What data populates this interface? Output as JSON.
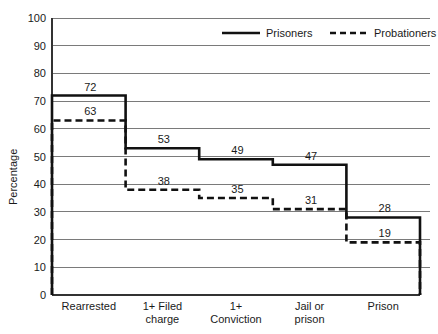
{
  "chart_data": {
    "type": "line",
    "title": "",
    "subtitle": "",
    "xlabel": "",
    "ylabel": "Percentage",
    "ylim": [
      0,
      100
    ],
    "ytick_step": 10,
    "yticks": [
      "0",
      "10",
      "20",
      "30",
      "40",
      "50",
      "60",
      "70",
      "80",
      "90",
      "100"
    ],
    "grid": true,
    "legend_position": "top-center",
    "step_style": "post",
    "categories": [
      "Rearrested",
      "1+ Filed charge",
      "1+ Conviction",
      "Jail or prison",
      "Prison"
    ],
    "category_lines": [
      [
        "Rearrested"
      ],
      [
        "1+ Filed",
        "charge"
      ],
      [
        "1+",
        "Conviction"
      ],
      [
        "Jail or",
        "prison"
      ],
      [
        "Prison"
      ]
    ],
    "series": [
      {
        "name": "Prisoners",
        "style": "solid",
        "color": "#111111",
        "values": [
          72,
          53,
          49,
          47,
          28
        ],
        "labels": [
          "72",
          "53",
          "49",
          "47",
          "28"
        ]
      },
      {
        "name": "Probationers",
        "style": "dashed",
        "color": "#111111",
        "values": [
          63,
          38,
          35,
          31,
          19
        ],
        "labels": [
          "63",
          "38",
          "35",
          "31",
          "19"
        ]
      }
    ]
  },
  "legend": {
    "items": [
      {
        "label": "Prisoners",
        "style": "solid"
      },
      {
        "label": "Probationers",
        "style": "dashed"
      }
    ]
  },
  "axis": {
    "y_title": "Percentage"
  },
  "colors": {
    "series": "#111111",
    "gridline": "#7a7a7a",
    "axis": "#333333",
    "background": "#ffffff",
    "text": "#1a1a1a"
  }
}
